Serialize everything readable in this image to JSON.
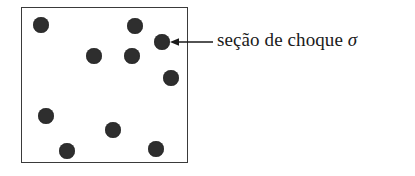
{
  "figure": {
    "title": "seção de choque",
    "background_color": "#ffffff"
  },
  "box": {
    "name": "scattering-region",
    "border_color": "#3a3a3a",
    "fill_color": "#ffffff",
    "x": 21,
    "y": 7,
    "width": 167,
    "height": 156
  },
  "particles": {
    "count": 10,
    "color": "#2e2e2e",
    "items": [
      {
        "cx": 41,
        "cy": 25,
        "r": 8
      },
      {
        "cx": 135,
        "cy": 26,
        "r": 8
      },
      {
        "cx": 162,
        "cy": 42,
        "r": 8
      },
      {
        "cx": 94,
        "cy": 56,
        "r": 8
      },
      {
        "cx": 132,
        "cy": 56,
        "r": 8
      },
      {
        "cx": 171,
        "cy": 78,
        "r": 8
      },
      {
        "cx": 46,
        "cy": 116,
        "r": 8
      },
      {
        "cx": 113,
        "cy": 130,
        "r": 8
      },
      {
        "cx": 67,
        "cy": 151,
        "r": 8
      },
      {
        "cx": 156,
        "cy": 149,
        "r": 8
      }
    ]
  },
  "annotation": {
    "arrow": {
      "color": "#1a1a1a",
      "from_x": 213,
      "to_x": 171,
      "y": 42,
      "direction": "left"
    },
    "label": {
      "text": "seção de choque ",
      "symbol": "σ",
      "full_text": "seção de choque σ",
      "color": "#1a1a1a",
      "font_size_px": 19
    }
  }
}
